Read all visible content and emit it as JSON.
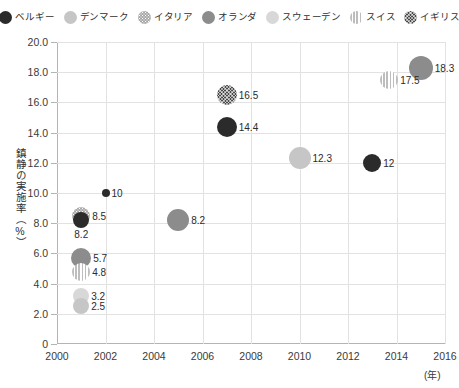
{
  "legend": {
    "items": [
      {
        "label": "ベルギー",
        "key": "belgium",
        "color": "#2b2b2b",
        "pattern": "solid"
      },
      {
        "label": "デンマーク",
        "key": "denmark",
        "color": "#c6c6c6",
        "pattern": "solid"
      },
      {
        "label": "イタリア",
        "key": "italy",
        "color": "#a8a8a8",
        "pattern": "dots"
      },
      {
        "label": "オランダ",
        "key": "netherlands",
        "color": "#8c8c8c",
        "pattern": "solid"
      },
      {
        "label": "スウェーデン",
        "key": "sweden",
        "color": "#d8d8d8",
        "pattern": "solid"
      },
      {
        "label": "スイス",
        "key": "switzerland",
        "color": "#bdbdbd",
        "pattern": "stripes"
      },
      {
        "label": "イギリス",
        "key": "uk",
        "color": "#4a4a4a",
        "pattern": "hatch"
      }
    ]
  },
  "chart_data": {
    "type": "scatter",
    "title": "",
    "xlabel": "(年)",
    "ylabel": "鎮静の実施率（%）",
    "xlim": [
      2000,
      2016
    ],
    "ylim": [
      0,
      20
    ],
    "xticks": [
      "2000",
      "2002",
      "2004",
      "2006",
      "2008",
      "2010",
      "2012",
      "2014",
      "2016"
    ],
    "yticks": [
      "0",
      "2.0",
      "4.0",
      "6.0",
      "8.0",
      "10.0",
      "12.0",
      "14.0",
      "16.0",
      "18.0",
      "20.0"
    ],
    "grid": true,
    "legend_position": "top",
    "points": [
      {
        "country": "イギリス",
        "key": "uk",
        "x": 2007,
        "y": 16.5,
        "label": "16.5",
        "r": 10,
        "label_side": "right"
      },
      {
        "country": "ベルギー",
        "key": "belgium",
        "x": 2007,
        "y": 14.4,
        "label": "14.4",
        "r": 10,
        "label_side": "right"
      },
      {
        "country": "オランダ",
        "key": "netherlands",
        "x": 2015,
        "y": 18.3,
        "label": "18.3",
        "r": 12,
        "label_side": "right"
      },
      {
        "country": "スイス",
        "key": "switzerland",
        "x": 2013.7,
        "y": 17.5,
        "label": "17.5",
        "r": 9,
        "label_side": "right"
      },
      {
        "country": "デンマーク",
        "key": "denmark",
        "x": 2010,
        "y": 12.3,
        "label": "12.3",
        "r": 11,
        "label_side": "right"
      },
      {
        "country": "ベルギー",
        "key": "belgium",
        "x": 2013,
        "y": 12,
        "label": "12",
        "r": 9,
        "label_side": "right"
      },
      {
        "country": "ベルギー",
        "key": "belgium",
        "x": 2002,
        "y": 10,
        "label": "10",
        "r": 4,
        "label_side": "right"
      },
      {
        "country": "オランダ",
        "key": "netherlands",
        "x": 2005,
        "y": 8.2,
        "label": "8.2",
        "r": 11,
        "label_side": "right"
      },
      {
        "country": "イタリア",
        "key": "italy",
        "x": 2001,
        "y": 8.5,
        "label": "8.5",
        "r": 9,
        "label_side": "right"
      },
      {
        "country": "ベルギー",
        "key": "belgium",
        "x": 2001,
        "y": 8.2,
        "label": "8.2",
        "r": 8,
        "label_side": "below"
      },
      {
        "country": "オランダ",
        "key": "netherlands",
        "x": 2001,
        "y": 5.7,
        "label": "5.7",
        "r": 10,
        "label_side": "right"
      },
      {
        "country": "スイス",
        "key": "switzerland",
        "x": 2001,
        "y": 4.8,
        "label": "4.8",
        "r": 9,
        "label_side": "right"
      },
      {
        "country": "スウェーデン",
        "key": "sweden",
        "x": 2001,
        "y": 3.2,
        "label": "3.2",
        "r": 8,
        "label_side": "right"
      },
      {
        "country": "デンマーク",
        "key": "denmark",
        "x": 2001,
        "y": 2.5,
        "label": "2.5",
        "r": 8,
        "label_side": "right"
      }
    ]
  }
}
